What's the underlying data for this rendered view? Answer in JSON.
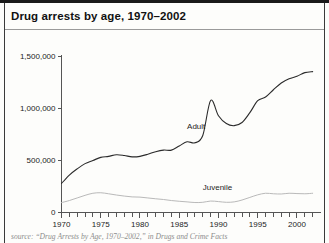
{
  "title": "Drug arrests by age, 1970–2002",
  "source_note": "source: “Drug Arrests by Age, 1970–2002,” in Drugs and Crime Facts",
  "labels": {
    "adult": "Adult",
    "juvenile": "Juvenile"
  },
  "colors": {
    "adult_line": "#2b2b2b",
    "juvenile_line": "#b9b9b9",
    "axis": "#555555",
    "title_rule": "#9a9a9a",
    "frame": "#1a1a1a",
    "text": "#1c1c1c",
    "source_text": "#8d8d8d",
    "background": "#fdfdfb"
  },
  "chart_data": {
    "type": "line",
    "title": "Drug arrests by age, 1970–2002",
    "xlabel": "",
    "ylabel": "",
    "xlim": [
      1970,
      2002
    ],
    "ylim": [
      0,
      1500000
    ],
    "grid": false,
    "legend": "inline-annotations",
    "ytick_labels": [
      "0",
      "500,000",
      "1,000,000",
      "1,500,000"
    ],
    "ytick_values": [
      0,
      500000,
      1000000,
      1500000
    ],
    "xtick_labels": [
      "1970",
      "1975",
      "1980",
      "1985",
      "1990",
      "1995",
      "2000"
    ],
    "xtick_values": [
      1970,
      1975,
      1980,
      1985,
      1990,
      1995,
      2000
    ],
    "minor_xticks_every": 1,
    "x": [
      1970,
      1971,
      1972,
      1973,
      1974,
      1975,
      1976,
      1977,
      1978,
      1979,
      1980,
      1981,
      1982,
      1983,
      1984,
      1985,
      1986,
      1987,
      1988,
      1989,
      1990,
      1991,
      1992,
      1993,
      1994,
      1995,
      1996,
      1997,
      1998,
      1999,
      2000,
      2001,
      2002
    ],
    "series": [
      {
        "name": "Adult",
        "color": "#2b2b2b",
        "values": [
          279000,
          360000,
          420000,
          470000,
          500000,
          530000,
          540000,
          555000,
          548000,
          535000,
          540000,
          560000,
          585000,
          600000,
          600000,
          640000,
          680000,
          670000,
          740000,
          1077000,
          930000,
          855000,
          835000,
          865000,
          960000,
          1075000,
          1110000,
          1180000,
          1245000,
          1285000,
          1310000,
          1345000,
          1355000
        ]
      },
      {
        "name": "Juvenile",
        "color": "#b9b9b9",
        "values": [
          95000,
          115000,
          140000,
          165000,
          185000,
          190000,
          180000,
          168000,
          158000,
          150000,
          148000,
          140000,
          132000,
          125000,
          115000,
          108000,
          102000,
          96000,
          98000,
          110000,
          105000,
          98000,
          102000,
          120000,
          145000,
          170000,
          185000,
          180000,
          178000,
          185000,
          182000,
          180000,
          185000
        ]
      }
    ],
    "annotations": [
      {
        "text": "Adult",
        "x": 1986,
        "y": 820000
      },
      {
        "text": "Juvenile",
        "x": 1988,
        "y": 240000
      }
    ]
  }
}
